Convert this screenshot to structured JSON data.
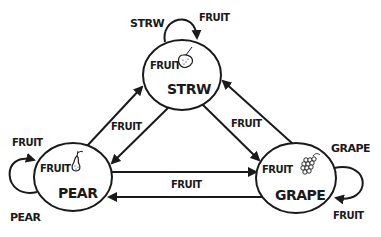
{
  "diagram": {
    "type": "state-machine",
    "colors": {
      "stroke": "#1a1a1a",
      "background": "#ffffff"
    },
    "states": [
      {
        "id": "strw",
        "input_label": "FRUIT",
        "output_label": "STRW",
        "icon": "strawberry-icon"
      },
      {
        "id": "pear",
        "input_label": "FRUIT",
        "output_label": "PEAR",
        "icon": "pear-icon"
      },
      {
        "id": "grape",
        "input_label": "FRUIT",
        "output_label": "GRAPE",
        "icon": "grape-icon"
      }
    ],
    "transitions": [
      {
        "from": "strw",
        "to": "strw",
        "label": "FRUIT",
        "loop_output_label": "STRW"
      },
      {
        "from": "pear",
        "to": "pear",
        "label": "FRUIT",
        "loop_output_label": "PEAR"
      },
      {
        "from": "grape",
        "to": "grape",
        "label": "FRUIT",
        "loop_output_label": "GRAPE"
      },
      {
        "from": "pear",
        "to": "strw",
        "label": "FRUIT"
      },
      {
        "from": "strw",
        "to": "pear",
        "label": "FRUIT"
      },
      {
        "from": "strw",
        "to": "grape",
        "label": "FRUIT"
      },
      {
        "from": "grape",
        "to": "strw",
        "label": "FRUIT"
      },
      {
        "from": "pear",
        "to": "grape",
        "label": "FRUIT"
      },
      {
        "from": "grape",
        "to": "pear",
        "label": "FRUIT"
      }
    ],
    "edge_labels": {
      "pear_strw": "FRUIT",
      "strw_grape": "FRUIT",
      "pear_grape": "FRUIT"
    }
  }
}
